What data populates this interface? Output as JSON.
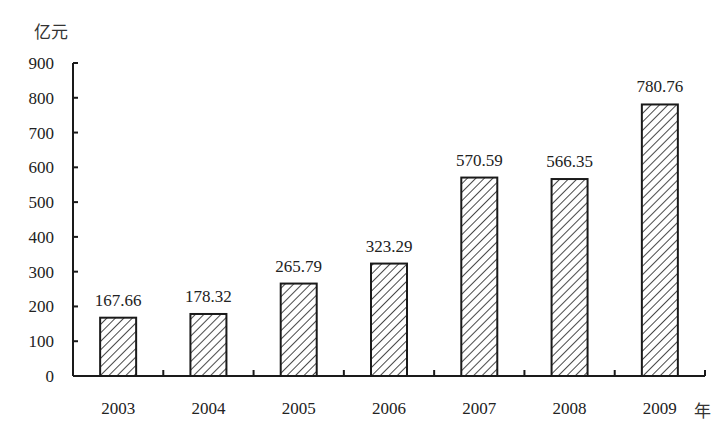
{
  "chart_data": {
    "type": "bar",
    "title": "",
    "xlabel": "年",
    "ylabel": "亿元",
    "categories": [
      "2003",
      "2004",
      "2005",
      "2006",
      "2007",
      "2008",
      "2009"
    ],
    "values": [
      167.66,
      178.32,
      265.79,
      323.29,
      570.59,
      566.35,
      780.76
    ],
    "data_labels": [
      "167.66",
      "178.32",
      "265.79",
      "323.29",
      "570.59",
      "566.35",
      "780.76"
    ],
    "ylim": [
      0,
      900
    ],
    "yticks": [
      0,
      100,
      200,
      300,
      400,
      500,
      600,
      700,
      800,
      900
    ],
    "grid": false,
    "legend": null,
    "bar_fill": "diagonal-hatch",
    "colors": {
      "bar_stroke": "#1a1a1a",
      "hatch": "#1a1a1a",
      "axis": "#1a1a1a",
      "text": "#222222"
    }
  },
  "labels": {
    "y_unit": "亿元",
    "x_unit": "年"
  }
}
